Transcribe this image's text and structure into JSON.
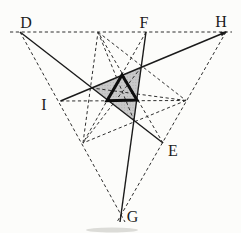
{
  "diagram": {
    "canvas": {
      "width": 241,
      "height": 233,
      "background": "#fcfcfa"
    },
    "colors": {
      "solid_line": "#1a1a1a",
      "dashed_line": "#2e2e2e",
      "thick_line": "#0d0d0d",
      "shade_fill": "#c9c9c9",
      "shade_dot": "#a9a9a9",
      "label": "#1c1c1c",
      "artifact": "#dcdcd8"
    },
    "points": {
      "D": [
        20,
        32
      ],
      "F": [
        146,
        32
      ],
      "H": [
        226,
        32
      ],
      "I": [
        60.5,
        101
      ],
      "E": [
        163,
        143
      ],
      "G": [
        121,
        215
      ],
      "V3": [
        98,
        32
      ],
      "V1": [
        186,
        100.5
      ],
      "V2": [
        83,
        143
      ],
      "L": [
        92,
        88
      ],
      "T": [
        141.2,
        67.2
      ],
      "B": [
        134,
        120.5
      ],
      "TA": [
        122,
        75
      ],
      "TL": [
        107,
        100.8
      ],
      "TR": [
        137,
        100
      ],
      "topL": [
        10,
        32
      ],
      "topR": [
        232,
        32
      ],
      "dgExt": [
        125,
        222
      ],
      "hgExt": [
        117,
        222
      ],
      "fgExt": [
        120,
        222
      ]
    },
    "point_labels": [
      {
        "text": "D",
        "x": 26,
        "y": 22
      },
      {
        "text": "F",
        "x": 144,
        "y": 22
      },
      {
        "text": "H",
        "x": 221,
        "y": 21.5
      },
      {
        "text": "I",
        "x": 44,
        "y": 104.5
      },
      {
        "text": "E",
        "x": 173,
        "y": 150
      },
      {
        "text": "G",
        "x": 132.5,
        "y": 216.5
      }
    ],
    "dashed_segments": [
      {
        "name": "outer-edge-D-H",
        "from": "topL",
        "to": "topR"
      },
      {
        "name": "outer-edge-D-G",
        "from": "D",
        "to": "dgExt"
      },
      {
        "name": "outer-edge-H-G",
        "from": "H",
        "to": "hgExt"
      },
      {
        "name": "inner-edge-V3-V1",
        "from": "V3",
        "to": "V1"
      },
      {
        "name": "inner-edge-V1-V2",
        "from": "V1",
        "to": "V2"
      },
      {
        "name": "inner-edge-V2-V3",
        "from": "V2",
        "to": "V3"
      },
      {
        "name": "median-V3-B",
        "from": "V3",
        "to": "B"
      },
      {
        "name": "median-V1-L",
        "from": "V1",
        "to": "L"
      },
      {
        "name": "median-V2-T",
        "from": "V2",
        "to": "T"
      },
      {
        "name": "horizontal-line-I-V1",
        "from": "I",
        "to": "V1"
      },
      {
        "name": "line-F-V2",
        "from": "F",
        "to": "V2"
      },
      {
        "name": "line-E-V3",
        "from": "E",
        "to": "V3"
      }
    ],
    "solid_segments": [
      {
        "name": "cevian-D-E",
        "from": "D",
        "to": "E"
      },
      {
        "name": "cevian-I-H",
        "from": "I",
        "to": "H"
      },
      {
        "name": "cevian-F-G",
        "from": "F",
        "to": "fgExt"
      }
    ],
    "shaded_triangle": [
      "L",
      "T",
      "B"
    ],
    "thick_triangle": [
      "TA",
      "TR",
      "TL"
    ],
    "arrowhead_points": "227.4,31.4 221.8,36.2 220.0,32.0",
    "artifact": {
      "cx": 112,
      "cy": 230,
      "rx": 26,
      "ry": 2.5
    },
    "style": {
      "dashed_width": 1,
      "solid_width": 1.4,
      "thick_width": 3,
      "dash_pattern": "3.2 2.6"
    }
  }
}
